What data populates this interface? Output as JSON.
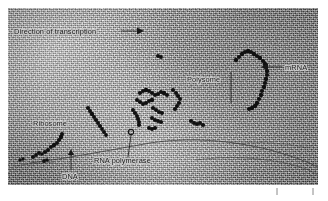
{
  "figure": {
    "kind": "electron-micrograph",
    "background_color": "#a9a9a9",
    "label_color": "#1a1a1a",
    "structure_color": "#101010",
    "plate": {
      "x": 8,
      "y": 8,
      "width": 310,
      "height": 177
    }
  },
  "labels": {
    "direction": "Direction of transcription",
    "ribosome": "Ribosome",
    "dna": "DNA",
    "rna_polymerase": "RNA polymerase",
    "polysome": "Polysome",
    "mrna": "mRNA"
  },
  "annotations": [
    {
      "id": "direction",
      "text": "Direction of transcription",
      "marker": "arrow-right",
      "x": 14,
      "y": 33
    },
    {
      "id": "ribosome",
      "text": "Ribosome",
      "marker": "none",
      "x": 33,
      "y": 124
    },
    {
      "id": "dna",
      "text": "DNA",
      "marker": "arrow-up",
      "x": 62,
      "y": 177
    },
    {
      "id": "rna-polymerase",
      "text": "RNA polymerase",
      "marker": "leader-line",
      "x": 94,
      "y": 163
    },
    {
      "id": "polysome",
      "text": "Polysome",
      "marker": "leader-line",
      "x": 187,
      "y": 81
    },
    {
      "id": "mrna",
      "text": "mRNA",
      "marker": "arrow-left",
      "x": 285,
      "y": 69
    }
  ],
  "scale_bar": {
    "ticks": 2,
    "x_start": 276,
    "x_end": 314,
    "y": 191,
    "label": ""
  }
}
